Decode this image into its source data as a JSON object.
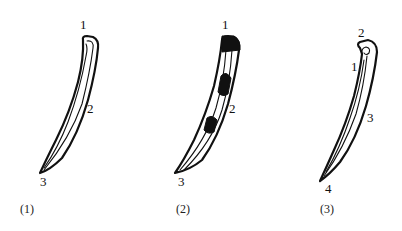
{
  "figures": [
    {
      "caption": "(1)",
      "labels": {
        "top": "1",
        "middle": "2",
        "tip": "3"
      }
    },
    {
      "caption": "(2)",
      "labels": {
        "top": "1",
        "middle": "2",
        "tip": "3"
      }
    },
    {
      "caption": "(3)",
      "labels": {
        "hook": "2",
        "left": "1",
        "middle": "3",
        "tip": "4"
      }
    }
  ],
  "colors": {
    "ink": "#111111",
    "background": "#ffffff"
  }
}
